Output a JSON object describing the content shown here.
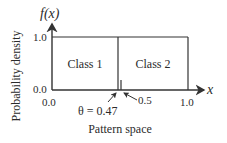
{
  "diagram": {
    "y_axis": {
      "label": "f(x)",
      "title": "Probability density",
      "ticks": [
        "1.0",
        "0.0"
      ]
    },
    "x_axis": {
      "label": "x",
      "title": "Pattern space",
      "ticks": [
        "0.0",
        "1.0"
      ]
    },
    "regions": [
      {
        "label": "Class 1"
      },
      {
        "label": "Class 2"
      }
    ],
    "annotations": {
      "threshold": "θ = 0.47",
      "midpoint": "0.5"
    },
    "colors": {
      "line": "#333333",
      "text": "#2b2b2b"
    }
  }
}
